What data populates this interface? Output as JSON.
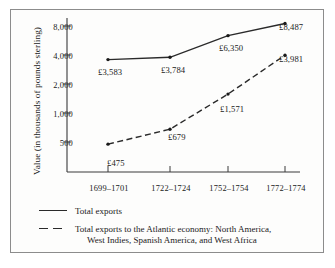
{
  "chart_data": {
    "type": "line",
    "title": "",
    "xlabel": "",
    "ylabel": "Value (in thousands of pounds sterling)",
    "categories": [
      "1699–1701",
      "1722–1724",
      "1752–1754",
      "1772–1774"
    ],
    "yscale": "log",
    "yticks": [
      500,
      1000,
      2000,
      4000,
      8000
    ],
    "ytick_labels": [
      "500",
      "1,000",
      "2,000",
      "4,000",
      "8,000"
    ],
    "ylim": [
      330,
      11000
    ],
    "grid": false,
    "legend_position": "below-axes",
    "series": [
      {
        "name": "Total exports",
        "style": "solid",
        "color": "#2a2a2a",
        "values": [
          3583,
          3784,
          6350,
          8487
        ],
        "point_labels": [
          "£3,583",
          "£3,784",
          "£6,350",
          "£8,487"
        ]
      },
      {
        "name": "Total exports to the Atlantic economy: North America, West Indies, Spanish America, and West Africa",
        "style": "dashed",
        "color": "#2a2a2a",
        "values": [
          475,
          679,
          1571,
          3981
        ],
        "point_labels": [
          "£475",
          "£679",
          "£1,571",
          "£3,981"
        ]
      }
    ]
  },
  "axis": {
    "ylabel": "Value (in thousands of pounds sterling)",
    "ytick_labels": [
      "8,000",
      "4,000",
      "2,000",
      "1,000",
      "500"
    ],
    "xtick_labels": [
      "1699–1701",
      "1722–1724",
      "1752–1754",
      "1772–1774"
    ]
  },
  "labels": {
    "upper": [
      "£3,583",
      "£3,784",
      "£6,350",
      "£8,487"
    ],
    "lower": [
      "£475",
      "£679",
      "£1,571",
      "£3,981"
    ]
  },
  "legend": {
    "series1": "Total exports",
    "series2_line1": "Total exports to the Atlantic economy: North America,",
    "series2_line2": "West Indies, Spanish America, and West Africa"
  },
  "colors": {
    "line": "#2a2a2a",
    "frame": "#8c8c8c",
    "axis": "#3a3a3a",
    "background": "#ffffff"
  }
}
